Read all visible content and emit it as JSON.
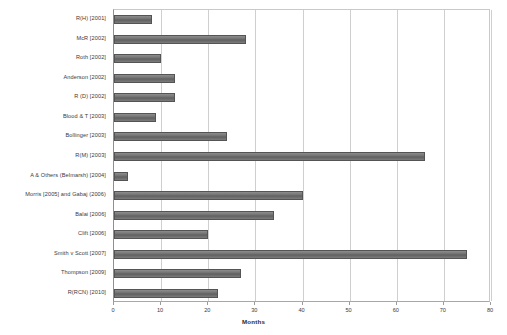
{
  "chart_data": {
    "type": "bar",
    "orientation": "horizontal",
    "title": "",
    "xlabel": "Months",
    "ylabel": "",
    "xlim": [
      0,
      80
    ],
    "xticks": [
      0,
      10,
      20,
      30,
      40,
      50,
      60,
      70,
      80
    ],
    "grid": true,
    "legend": false,
    "bar_color": "#6f6f6f",
    "categories": [
      "R(H) [2001]",
      "McR [2002]",
      "Roth [2002]",
      "Anderson [2002]",
      "R (D) [2002]",
      "Blood & T [2003]",
      "Bollinger [2003]",
      "R(M) [2003]",
      "A & Others (Belmarsh) [2004]",
      "Morris [2005] and Gabaj (2006)",
      "Balai [2006]",
      "Clift [2006]",
      "Smith v Scott [2007]",
      "Thompson [2009]",
      "R(RCN) [2010]"
    ],
    "values": [
      8,
      28,
      10,
      13,
      13,
      9,
      24,
      66,
      3,
      40,
      34,
      20,
      75,
      27,
      22
    ]
  }
}
